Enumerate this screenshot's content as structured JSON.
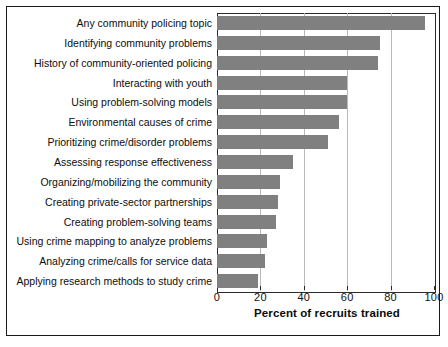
{
  "chart_data": {
    "type": "bar",
    "orientation": "horizontal",
    "title": "",
    "xlabel": "Percent of recruits trained",
    "ylabel": "",
    "xlim": [
      0,
      100
    ],
    "xticks": [
      0,
      20,
      40,
      60,
      80,
      100
    ],
    "grid": true,
    "legend": null,
    "bar_color": "#808080",
    "categories": [
      "Any community policing topic",
      "Identifying community problems",
      "History of community-oriented policing",
      "Interacting with youth",
      "Using problem-solving models",
      "Environmental causes of crime",
      "Prioritizing crime/disorder problems",
      "Assessing response effectiveness",
      "Organizing/mobilizing the community",
      "Creating private-sector partnerships",
      "Creating problem-solving teams",
      "Using crime mapping to analyze problems",
      "Analyzing crime/calls for service data",
      "Applying research methods to study crime"
    ],
    "values": [
      96,
      75,
      74,
      60,
      60,
      56,
      51,
      35,
      29,
      28,
      27,
      23,
      22,
      19
    ]
  }
}
